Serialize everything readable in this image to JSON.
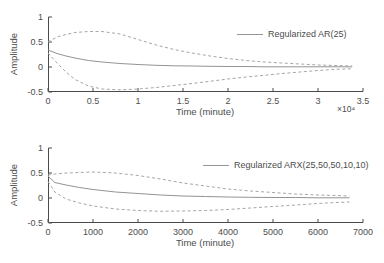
{
  "figure": {
    "background": "#ffffff",
    "axis_color": "#4a4a4a",
    "text_color": "#4d4d4d",
    "solid_line_color": "#949494",
    "dashed_line_color": "#a6a6a6"
  },
  "chart_data": [
    {
      "type": "line",
      "legend": "Regularized AR(25)",
      "legend_position": "top-right-inside",
      "xlabel": "Time (minute)",
      "ylabel": "Amplitude",
      "x_scale_note": "×10⁴",
      "grid": false,
      "xlim": [
        0,
        35000
      ],
      "ylim": [
        -0.5,
        1
      ],
      "xticks": {
        "values": [
          0,
          5000,
          10000,
          15000,
          20000,
          25000,
          30000,
          35000
        ],
        "labels": [
          "0",
          "0.5",
          "1",
          "1.5",
          "2",
          "2.5",
          "3",
          "3.5"
        ]
      },
      "yticks": {
        "values": [
          1,
          0.5,
          0,
          -0.5
        ],
        "labels": [
          "1",
          "0.5",
          "0",
          "-0.5"
        ]
      },
      "series": [
        {
          "name": "impulse-response",
          "label": "Regularized AR(25)",
          "style": "solid",
          "color": "#949494",
          "x": [
            0,
            1000,
            2000,
            3000,
            4500,
            6000,
            8000,
            10000,
            12000,
            14000,
            16000,
            18000,
            20000,
            22000,
            24000,
            26000,
            28000,
            30000,
            32000,
            33800
          ],
          "y": [
            0.34,
            0.27,
            0.22,
            0.18,
            0.13,
            0.1,
            0.07,
            0.05,
            0.035,
            0.025,
            0.02,
            0.015,
            0.01,
            0.01,
            0.005,
            0.005,
            0.005,
            0.005,
            0.005,
            0.005
          ]
        },
        {
          "name": "confidence-upper",
          "label": "upper confidence bound",
          "style": "dashed",
          "color": "#a6a6a6",
          "x": [
            0,
            1000,
            2000,
            3000,
            4500,
            6000,
            8000,
            10000,
            12000,
            14000,
            16000,
            18000,
            20000,
            22000,
            24000,
            26000,
            28000,
            30000,
            32000,
            33800
          ],
          "y": [
            0.5,
            0.6,
            0.65,
            0.69,
            0.71,
            0.71,
            0.66,
            0.55,
            0.44,
            0.35,
            0.28,
            0.22,
            0.17,
            0.13,
            0.1,
            0.08,
            0.06,
            0.04,
            0.03,
            0.02
          ]
        },
        {
          "name": "confidence-lower",
          "label": "lower confidence bound",
          "style": "dashed",
          "color": "#a6a6a6",
          "x": [
            0,
            1000,
            2000,
            3000,
            4500,
            6000,
            8000,
            10000,
            12000,
            14000,
            16000,
            18000,
            20000,
            22000,
            24000,
            26000,
            28000,
            30000,
            32000,
            33800
          ],
          "y": [
            0.28,
            0.08,
            -0.1,
            -0.25,
            -0.38,
            -0.44,
            -0.455,
            -0.44,
            -0.41,
            -0.37,
            -0.33,
            -0.285,
            -0.24,
            -0.2,
            -0.165,
            -0.13,
            -0.1,
            -0.07,
            -0.045,
            -0.035
          ]
        }
      ]
    },
    {
      "type": "line",
      "legend": "Regularized ARX(25,50,50,10,10)",
      "legend_position": "top-right-inside",
      "xlabel": "Time (minute)",
      "ylabel": "Amplitude",
      "x_scale_note": "",
      "grid": false,
      "xlim": [
        0,
        7000
      ],
      "ylim": [
        -0.5,
        1
      ],
      "xticks": {
        "values": [
          0,
          1000,
          2000,
          3000,
          4000,
          5000,
          6000,
          7000
        ],
        "labels": [
          "0",
          "1000",
          "2000",
          "3000",
          "4000",
          "5000",
          "6000",
          "7000"
        ]
      },
      "yticks": {
        "values": [
          1,
          0.5,
          0,
          -0.5
        ],
        "labels": [
          "1",
          "0.5",
          "0",
          "-0.5"
        ]
      },
      "series": [
        {
          "name": "impulse-response",
          "label": "Regularized ARX(25,50,50,10,10)",
          "style": "solid",
          "color": "#949494",
          "x": [
            0,
            150,
            400,
            700,
            1000,
            1500,
            2000,
            2500,
            3000,
            3500,
            4000,
            4500,
            5000,
            5500,
            6000,
            6400,
            6700
          ],
          "y": [
            0.44,
            0.31,
            0.26,
            0.21,
            0.17,
            0.12,
            0.09,
            0.06,
            0.04,
            0.03,
            0.02,
            0.015,
            0.01,
            0.01,
            0.005,
            0.005,
            0.005
          ]
        },
        {
          "name": "confidence-upper",
          "label": "upper confidence bound",
          "style": "dashed",
          "color": "#a6a6a6",
          "x": [
            0,
            150,
            400,
            700,
            1000,
            1500,
            2000,
            2500,
            3000,
            3500,
            4000,
            4500,
            5000,
            5500,
            6000,
            6400,
            6700
          ],
          "y": [
            0.46,
            0.48,
            0.5,
            0.51,
            0.52,
            0.5,
            0.45,
            0.38,
            0.3,
            0.24,
            0.18,
            0.14,
            0.11,
            0.08,
            0.06,
            0.05,
            0.04
          ]
        },
        {
          "name": "confidence-lower",
          "label": "lower confidence bound",
          "style": "dashed",
          "color": "#a6a6a6",
          "x": [
            0,
            150,
            400,
            700,
            1000,
            1500,
            2000,
            2500,
            3000,
            3500,
            4000,
            4500,
            5000,
            5500,
            6000,
            6400,
            6700
          ],
          "y": [
            0.33,
            0.12,
            -0.02,
            -0.1,
            -0.16,
            -0.22,
            -0.25,
            -0.265,
            -0.26,
            -0.25,
            -0.23,
            -0.2,
            -0.17,
            -0.14,
            -0.11,
            -0.09,
            -0.08
          ]
        }
      ]
    }
  ]
}
